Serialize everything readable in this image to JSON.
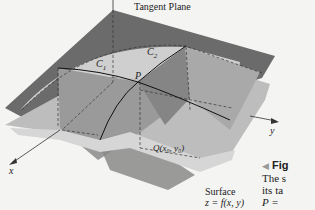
{
  "figure": {
    "title_label": "Tangent Plane",
    "curve1_label": "C",
    "curve1_sub": "1",
    "curve2_label": "C",
    "curve2_sub": "2",
    "point_label": "P",
    "projection_label": "Q(x₀, y₀)",
    "x_axis_label": "x",
    "y_axis_label": "y",
    "surface_label_line1": "Surface",
    "surface_label_line2": "z = f(x, y)"
  },
  "caption": {
    "marker": "◀",
    "heading": "Fig",
    "line1": "The s",
    "line2": "its ta",
    "line3": "P ="
  },
  "colors": {
    "tangent_plane": "#6b6b6b",
    "surface_light": "#c4c4c4",
    "surface_mid": "#9e9e9e",
    "cutting_plane": "#7d7d7d",
    "background": "#f4f4f2"
  }
}
